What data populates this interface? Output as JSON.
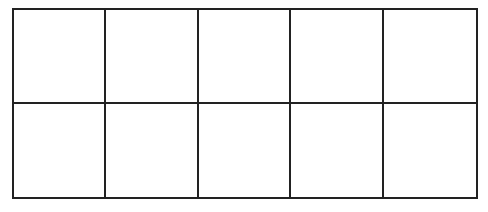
{
  "diagram": {
    "type": "empty-grid",
    "rows": 2,
    "columns": 5,
    "line_color": "#222222",
    "cells": [
      [
        "",
        "",
        "",
        "",
        ""
      ],
      [
        "",
        "",
        "",
        "",
        ""
      ]
    ]
  }
}
